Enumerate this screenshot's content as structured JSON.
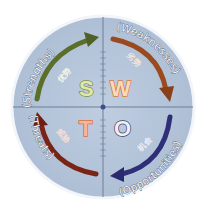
{
  "diagram": {
    "colors": {
      "background": "#ffffff",
      "circle_fill": "#b6c5d9",
      "circle_border": "#f2f5f9",
      "axis": "#6d7f98",
      "center_dot": "#3b4f8c"
    },
    "quadrants": [
      {
        "id": "strengths",
        "letter": "S",
        "english": "(Strengths)",
        "chinese": "优势",
        "arrow_color": "#5b6e2a",
        "letter_fill": "#dfe8a8",
        "letter_stroke": "#7c8f3c",
        "chinese_color": "#f3f6ea",
        "position": "top-left"
      },
      {
        "id": "weaknesses",
        "letter": "W",
        "english": "(Weaknesses)",
        "chinese": "劣势",
        "arrow_color": "#9a4a1e",
        "letter_fill": "#f8d9b8",
        "letter_stroke": "#d8793a",
        "chinese_color": "#f7e5d5",
        "position": "top-right"
      },
      {
        "id": "threats",
        "letter": "T",
        "english": "(Threats)",
        "chinese": "威胁",
        "arrow_color": "#7a2416",
        "letter_fill": "#f6b69a",
        "letter_stroke": "#e06a3c",
        "chinese_color": "#f5ded5",
        "position": "bottom-left"
      },
      {
        "id": "opportunities",
        "letter": "O",
        "english": "(Opportunities)",
        "chinese": "机会",
        "arrow_color": "#2f2f78",
        "letter_fill": "#eef0f8",
        "letter_stroke": "#3a3d5c",
        "chinese_color": "#eceef8",
        "position": "bottom-right"
      }
    ]
  }
}
